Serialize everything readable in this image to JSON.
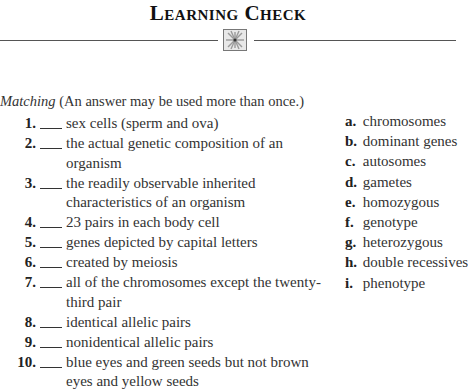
{
  "header": {
    "title": "Learning Check",
    "ornament_icon": "starburst-ornament-icon"
  },
  "instructions": {
    "label": "Matching",
    "note": " (An answer may be used more than once.)"
  },
  "items": [
    {
      "number": "1.",
      "blank": "___",
      "text": "sex cells (sperm and ova)"
    },
    {
      "number": "2.",
      "blank": "___",
      "text": "the actual genetic composition of an organism"
    },
    {
      "number": "3.",
      "blank": "___",
      "text": "the readily observable inherited characteristics of an organism"
    },
    {
      "number": "4.",
      "blank": "___",
      "text": "23 pairs in each body cell"
    },
    {
      "number": "5.",
      "blank": "___",
      "text": "genes depicted by capital letters"
    },
    {
      "number": "6.",
      "blank": "___",
      "text": "created by meiosis"
    },
    {
      "number": "7.",
      "blank": "___",
      "text": "all of the chromosomes except the twenty-third pair"
    },
    {
      "number": "8.",
      "blank": "___",
      "text": "identical allelic pairs"
    },
    {
      "number": "9.",
      "blank": "___",
      "text": "nonidentical allelic pairs"
    },
    {
      "number": "10.",
      "blank": "___",
      "text": "blue eyes and green seeds but not brown eyes and yellow seeds"
    }
  ],
  "answers": [
    {
      "letter": "a.",
      "text": "chromosomes"
    },
    {
      "letter": "b.",
      "text": "dominant genes"
    },
    {
      "letter": "c.",
      "text": "autosomes"
    },
    {
      "letter": "d.",
      "text": "gametes"
    },
    {
      "letter": "e.",
      "text": "homozygous"
    },
    {
      "letter": "f.",
      "text": "genotype"
    },
    {
      "letter": "g.",
      "text": "heterozygous"
    },
    {
      "letter": "h.",
      "text": "double recessives"
    },
    {
      "letter": "i.",
      "text": "phenotype"
    }
  ]
}
